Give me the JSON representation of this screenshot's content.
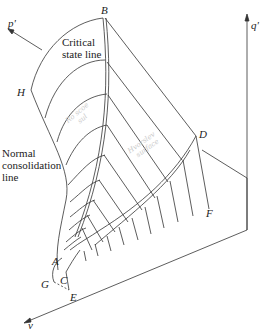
{
  "diagram": {
    "axes": {
      "p_prime": "p'",
      "q_prime": "q'",
      "v": "v"
    },
    "points": {
      "A": "A",
      "B": "B",
      "C": "C",
      "D": "D",
      "E": "E",
      "F": "F",
      "G": "G",
      "H": "H"
    },
    "labels": {
      "critical_state_line": "Critical\nstate line",
      "normal_consolidation_line": "Normal\nconsolidation\nline"
    },
    "annotations": {
      "handwritten_1": "Ro scoe\n    sul",
      "handwritten_2": "Hvorslev\n  surface"
    },
    "colors": {
      "line": "#333333",
      "background": "#ffffff",
      "pencil": "#c9c9c9"
    }
  }
}
